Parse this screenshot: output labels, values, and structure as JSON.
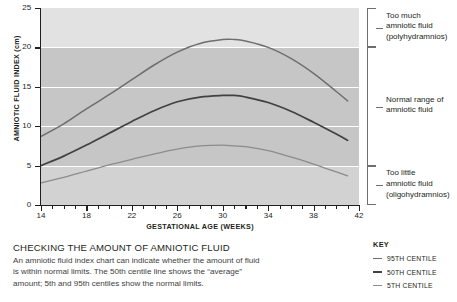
{
  "chart_data": {
    "type": "line",
    "title": "",
    "xlabel": "GESTATIONAL AGE (WEEKS)",
    "ylabel": "AMNIOTIC FLUID INDEX (cm)",
    "xlim": [
      14,
      42
    ],
    "ylim": [
      0,
      25
    ],
    "x_ticks": [
      14,
      18,
      22,
      26,
      30,
      34,
      38,
      42
    ],
    "x_minor_tick_step": 1,
    "y_ticks": [
      0,
      5,
      10,
      15,
      20,
      25
    ],
    "grid": "horizontal white gridlines at 5, 10, 15, 20",
    "legend_position": "bottom-right",
    "x": [
      14,
      16,
      18,
      20,
      22,
      24,
      26,
      28,
      30,
      31,
      32,
      34,
      36,
      38,
      40,
      41
    ],
    "series": [
      {
        "name": "95TH CENTILE",
        "color": "#6d6e71",
        "values": [
          8.7,
          10.3,
          12.2,
          14.0,
          15.9,
          17.8,
          19.4,
          20.5,
          21.0,
          21.0,
          20.8,
          20.0,
          18.6,
          16.7,
          14.4,
          13.2
        ]
      },
      {
        "name": "50TH CENTILE",
        "color": "#414042",
        "values": [
          5.0,
          6.2,
          7.6,
          9.1,
          10.6,
          12.0,
          13.1,
          13.7,
          13.9,
          13.9,
          13.7,
          13.0,
          11.9,
          10.5,
          9.0,
          8.2
        ]
      },
      {
        "name": "5TH CENTILE",
        "color": "#8a8c8e",
        "values": [
          2.8,
          3.5,
          4.3,
          5.1,
          5.8,
          6.5,
          7.1,
          7.5,
          7.6,
          7.5,
          7.4,
          6.9,
          6.1,
          5.2,
          4.2,
          3.7
        ]
      }
    ],
    "bands": [
      {
        "name": "Too much amniotic fluid (polyhydramnios)",
        "from": 20,
        "to": 25,
        "color": "#e2e2e2"
      },
      {
        "name": "Normal range of amniotic fluid",
        "from": 5,
        "to": 20,
        "color": "#c6c6c6"
      },
      {
        "name": "Too little amniotic fluid (oligohydramnios)",
        "from": 0,
        "to": 5,
        "color": "#d2d2d2"
      }
    ]
  },
  "axes": {
    "y_title": "AMNIOTIC FLUID INDEX (cm)",
    "x_title": "GESTATIONAL AGE (WEEKS)",
    "y_tick_labels": [
      "0",
      "5",
      "10",
      "15",
      "20",
      "25"
    ],
    "x_tick_labels": [
      "14",
      "18",
      "22",
      "26",
      "30",
      "34",
      "38",
      "42"
    ]
  },
  "annotations": [
    {
      "line1": "Too much",
      "line2": "amniotic fluid",
      "line3": "(polyhydramnios)"
    },
    {
      "line1": "Normal range of",
      "line2": "amniotic fluid",
      "line3": ""
    },
    {
      "line1": "Too little",
      "line2": "amniotic fluid",
      "line3": "(oligohydramnios)"
    }
  ],
  "caption": {
    "title": "CHECKING THE AMOUNT OF AMNIOTIC FLUID",
    "body": "An amniotic fluid index chart can indicate whether the amount of fluid is within normal limits. The 50th centile line shows the “average” amount; 5th and 95th centiles show the normal limits."
  },
  "key": {
    "title": "KEY",
    "items": [
      {
        "label": "95TH CENTILE",
        "color": "#6d6e71"
      },
      {
        "label": "50TH CENTILE",
        "color": "#414042"
      },
      {
        "label": "5TH CENTILE",
        "color": "#8a8c8e"
      }
    ]
  },
  "colors": {
    "band_high": "#e2e2e2",
    "band_normal": "#c6c6c6",
    "band_low": "#d2d2d2",
    "gridline": "#ffffff",
    "axis": "#231f20",
    "bracket": "#6d6e71"
  }
}
